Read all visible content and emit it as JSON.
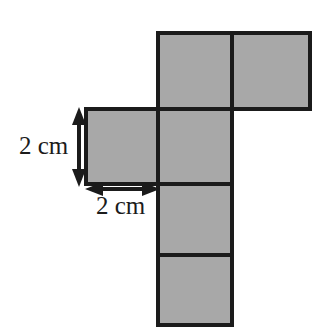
{
  "figure": {
    "unit_label": "cm",
    "square_side_cm": 2,
    "fill_color": "#a8a8a8",
    "stroke_color": "#1b1b1b",
    "background_color": "#ffffff",
    "stroke_width_px": 4,
    "square_size_px": 74,
    "squares": [
      {
        "name": "top-left-square",
        "x": 158,
        "y": 33,
        "w": 74,
        "h": 76
      },
      {
        "name": "top-right-square",
        "x": 232,
        "y": 33,
        "w": 78,
        "h": 76
      },
      {
        "name": "middle-left-square",
        "x": 86,
        "y": 109,
        "w": 72,
        "h": 75
      },
      {
        "name": "middle-center-square",
        "x": 158,
        "y": 109,
        "w": 74,
        "h": 75
      },
      {
        "name": "lower-square",
        "x": 158,
        "y": 184,
        "w": 74,
        "h": 71
      },
      {
        "name": "bottom-square",
        "x": 158,
        "y": 255,
        "w": 74,
        "h": 70
      }
    ]
  },
  "dimensions": {
    "vertical": {
      "label": "2 cm",
      "value": 2,
      "unit": "cm",
      "axis": "vertical",
      "arrow_x": 79,
      "arrow_y_start": 110,
      "arrow_y_end": 184
    },
    "horizontal": {
      "label": "2 cm",
      "value": 2,
      "unit": "cm",
      "axis": "horizontal",
      "arrow_y": 189,
      "arrow_x_start": 88,
      "arrow_x_end": 157
    }
  }
}
